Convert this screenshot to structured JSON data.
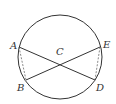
{
  "diagram": {
    "type": "geometry",
    "circle": {
      "cx": 60,
      "cy": 57,
      "r": 42
    },
    "points": {
      "A": {
        "x": 19,
        "y": 47,
        "label": "A"
      },
      "B": {
        "x": 26,
        "y": 80,
        "label": "B"
      },
      "C": {
        "x": 60,
        "y": 59,
        "label": "C"
      },
      "D": {
        "x": 95,
        "y": 80,
        "label": "D"
      },
      "E": {
        "x": 100,
        "y": 47,
        "label": "E"
      }
    },
    "segments": [
      {
        "from": "A",
        "to": "D",
        "style": "solid"
      },
      {
        "from": "B",
        "to": "E",
        "style": "solid"
      },
      {
        "from": "A",
        "to": "B",
        "style": "dashed"
      },
      {
        "from": "E",
        "to": "D",
        "style": "dashed"
      }
    ],
    "colors": {
      "stroke": "#333333"
    }
  }
}
